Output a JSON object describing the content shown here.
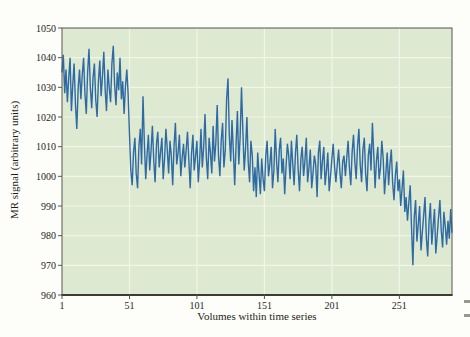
{
  "figure": {
    "xlabel": "Volumes within time series",
    "ylabel": "MR signal (arbitrary units)"
  },
  "chart_data": {
    "type": "line",
    "title": "",
    "xlabel": "Volumes within time series",
    "ylabel": "MR signal (arbitrary units)",
    "x_start": 1,
    "xlim": [
      1,
      290
    ],
    "ylim": [
      960,
      1050
    ],
    "xticks": [
      1,
      51,
      101,
      151,
      201,
      251
    ],
    "yticks": [
      960,
      970,
      980,
      990,
      1000,
      1010,
      1020,
      1030,
      1040,
      1050
    ],
    "grid": true,
    "legend": "none",
    "line_color": "#2e6aa3",
    "plot_bg": "#dde9d0",
    "grid_color": "#f1f6e8",
    "frame_color": "#57584c",
    "bottom_axis_color": "#3b3c32",
    "values": [
      1035,
      1041,
      1028,
      1036,
      1025,
      1033,
      1040,
      1022,
      1031,
      1038,
      1024,
      1016,
      1030,
      1036,
      1026,
      1034,
      1040,
      1028,
      1021,
      1035,
      1043,
      1030,
      1023,
      1033,
      1038,
      1026,
      1020,
      1032,
      1039,
      1027,
      1034,
      1042,
      1029,
      1022,
      1036,
      1030,
      1025,
      1038,
      1044,
      1031,
      1024,
      1035,
      1029,
      1040,
      1026,
      1032,
      1021,
      1030,
      1036,
      1028,
      1014,
      1002,
      997,
      1008,
      1013,
      1001,
      996,
      1010,
      1016,
      1004,
      1027,
      1012,
      999,
      1007,
      1014,
      1002,
      1009,
      1017,
      1005,
      998,
      1011,
      1015,
      1003,
      1008,
      1013,
      999,
      1006,
      1016,
      1009,
      1001,
      1012,
      1007,
      997,
      1010,
      1018,
      1004,
      1008,
      1014,
      1000,
      1006,
      1011,
      1003,
      1009,
      1015,
      1005,
      996,
      1008,
      1014,
      1002,
      1007,
      1012,
      998,
      1005,
      1016,
      1003,
      1010,
      1021,
      1006,
      999,
      1013,
      1008,
      1001,
      1017,
      1005,
      1011,
      1024,
      1007,
      1000,
      1012,
      1018,
      1003,
      1009,
      1026,
      1033,
      1014,
      1005,
      1019,
      1008,
      997,
      1011,
      1022,
      1004,
      1013,
      1030,
      1016,
      1002,
      1009,
      1020,
      1005,
      998,
      1012,
      1007,
      995,
      1003,
      993,
      1008,
      1001,
      994,
      1006,
      999,
      995,
      1007,
      1012,
      1000,
      1004,
      1010,
      996,
      1002,
      1016,
      1005,
      998,
      1009,
      1013,
      1001,
      1006,
      994,
      1003,
      1011,
      1007,
      999,
      1012,
      1004,
      997,
      1008,
      1014,
      1002,
      995,
      1006,
      1010,
      1000,
      1005,
      1013,
      998,
      1003,
      1009,
      996,
      1001,
      1007,
      1004,
      993,
      1008,
      1012,
      999,
      1005,
      1010,
      997,
      1002,
      1008,
      995,
      1000,
      1006,
      1011,
      1003,
      998,
      1004,
      1009,
      1001,
      996,
      1005,
      1007,
      1000,
      1006,
      1012,
      1003,
      997,
      1008,
      1014,
      1005,
      999,
      1010,
      1016,
      1004,
      998,
      1009,
      1013,
      1001,
      995,
      1007,
      1011,
      1002,
      1018,
      1008,
      996,
      1005,
      1010,
      999,
      1003,
      1012,
      1006,
      994,
      1001,
      1008,
      997,
      1004,
      1009,
      998,
      992,
      1000,
      1005,
      995,
      999,
      990,
      996,
      1002,
      988,
      993,
      985,
      991,
      997,
      983,
      970,
      986,
      992,
      978,
      984,
      990,
      975,
      981,
      987,
      993,
      979,
      973,
      985,
      991,
      977,
      983,
      989,
      974,
      980,
      986,
      992,
      982,
      976,
      988,
      983,
      977,
      985,
      979,
      989,
      981
    ]
  }
}
